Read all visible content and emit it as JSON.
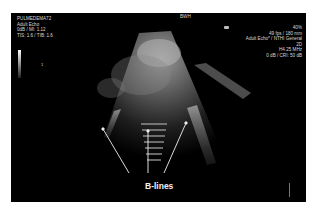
{
  "image": {
    "description": "Lung ultrasound showing B-lines",
    "overlay_left": {
      "line1": "PULMEDEMA72",
      "line2": "Adult Echo",
      "line3": "0dB / MI: 1.12",
      "line4": "TIS: 1.6 / TIB: 1.6"
    },
    "overlay_center": "BWH",
    "overlay_right": {
      "line1": "40%",
      "line2": "49 fps / 180 mm",
      "line3": "Adult Echo* / NTHI General",
      "line4": "2D",
      "line5": "H4.25 MHz",
      "line6": "0 dB / CRI: 50 dB"
    },
    "scale_marker": "1",
    "annotation": {
      "label": "B-lines",
      "arrow_count": 3,
      "color": "#ffffff"
    },
    "colors": {
      "background": "#ffffff",
      "screen": "#000000",
      "text": "#d8d8d8"
    }
  }
}
